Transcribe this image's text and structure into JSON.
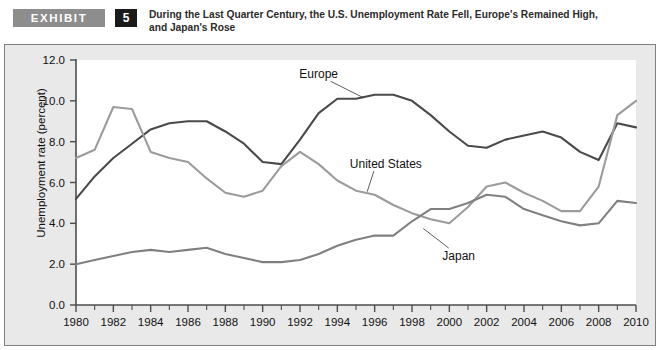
{
  "header": {
    "exhibit_tag": "EXHIBIT",
    "exhibit_number": "5",
    "title_line1": "During the Last Quarter Century, the U.S. Unemployment Rate Fell, Europe's Remained High,",
    "title_line2": "and Japan's Rose"
  },
  "chart_data": {
    "type": "line",
    "title": "During the Last Quarter Century, the U.S. Unemployment Rate Fell, Europe's Remained High, and Japan's Rose",
    "xlabel": "",
    "ylabel": "Unemployment rate (percent)",
    "ylim": [
      0.0,
      12.0
    ],
    "xlim": [
      1980,
      2010
    ],
    "ytick_labels": [
      "0.0",
      "2.0",
      "4.0",
      "6.0",
      "8.0",
      "10.0",
      "12.0"
    ],
    "ytick_values": [
      0.0,
      2.0,
      4.0,
      6.0,
      8.0,
      10.0,
      12.0
    ],
    "xtick_labels": [
      "1980",
      "1982",
      "1984",
      "1986",
      "1988",
      "1990",
      "1992",
      "1994",
      "1996",
      "1998",
      "2000",
      "2002",
      "2004",
      "2006",
      "2008",
      "2010"
    ],
    "xtick_values": [
      1980,
      1982,
      1984,
      1986,
      1988,
      1990,
      1992,
      1994,
      1996,
      1998,
      2000,
      2002,
      2004,
      2006,
      2008,
      2010
    ],
    "minor_xticks": [
      1981,
      1983,
      1985,
      1987,
      1989,
      1991,
      1993,
      1995,
      1997,
      1999,
      2001,
      2003,
      2005,
      2007,
      2009
    ],
    "grid": false,
    "legend_position": "inline-annotations",
    "x": [
      1980,
      1981,
      1982,
      1983,
      1984,
      1985,
      1986,
      1987,
      1988,
      1989,
      1990,
      1991,
      1992,
      1993,
      1994,
      1995,
      1996,
      1997,
      1998,
      1999,
      2000,
      2001,
      2002,
      2003,
      2004,
      2005,
      2006,
      2007,
      2008,
      2009,
      2010
    ],
    "series": [
      {
        "name": "Europe",
        "color": "#4a4a4a",
        "label_x": 1993,
        "label_y": 11.3,
        "values": [
          5.2,
          6.3,
          7.2,
          7.9,
          8.6,
          8.9,
          9.0,
          9.0,
          8.5,
          7.9,
          7.0,
          6.9,
          8.1,
          9.4,
          10.1,
          10.1,
          10.3,
          10.3,
          10.0,
          9.3,
          8.5,
          7.8,
          7.7,
          8.1,
          8.3,
          8.5,
          8.2,
          7.5,
          7.1,
          8.9,
          8.7
        ]
      },
      {
        "name": "United States",
        "color": "#9b9b9b",
        "label_x": 1996.6,
        "label_y": 6.9,
        "values": [
          7.2,
          7.6,
          9.7,
          9.6,
          7.5,
          7.2,
          7.0,
          6.2,
          5.5,
          5.3,
          5.6,
          6.8,
          7.5,
          6.9,
          6.1,
          5.6,
          5.4,
          4.9,
          4.5,
          4.2,
          4.0,
          4.8,
          5.8,
          6.0,
          5.5,
          5.1,
          4.6,
          4.6,
          5.8,
          9.3,
          10.0
        ]
      },
      {
        "name": "Japan",
        "color": "#808080",
        "label_x": 2000.5,
        "label_y": 2.4,
        "values": [
          2.0,
          2.2,
          2.4,
          2.6,
          2.7,
          2.6,
          2.7,
          2.8,
          2.5,
          2.3,
          2.1,
          2.1,
          2.2,
          2.5,
          2.9,
          3.2,
          3.4,
          3.4,
          4.1,
          4.7,
          4.7,
          5.0,
          5.4,
          5.3,
          4.7,
          4.4,
          4.1,
          3.9,
          4.0,
          5.1,
          5.0
        ]
      }
    ]
  }
}
